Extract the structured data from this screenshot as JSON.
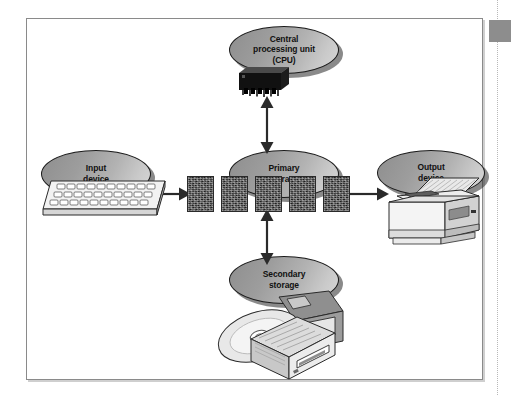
{
  "figure": {
    "nodes": [
      {
        "id": "cpu",
        "label": "Central\nprocessing unit\n(CPU)",
        "icon": "microchip-icon"
      },
      {
        "id": "input",
        "label": "Input\ndevice",
        "icon": "keyboard-icon"
      },
      {
        "id": "primary",
        "label": "Primary\nstorage",
        "icon": "memory-modules-icon"
      },
      {
        "id": "output",
        "label": "Output\ndevice",
        "icon": "printer-icon"
      },
      {
        "id": "secondary",
        "label": "Secondary\nstorage",
        "icon": "disk-drive-icon"
      }
    ],
    "memory_blocks": [
      "",
      "",
      "",
      "",
      ""
    ],
    "connections": [
      {
        "id": "input-to-primary",
        "from": "input",
        "to": "primary",
        "style": "single",
        "direction": "right"
      },
      {
        "id": "primary-to-output",
        "from": "primary",
        "to": "output",
        "style": "single",
        "direction": "right"
      },
      {
        "id": "cpu-to-primary",
        "from": "cpu",
        "to": "primary",
        "style": "double",
        "direction": "vertical"
      },
      {
        "id": "primary-to-secondary",
        "from": "primary",
        "to": "secondary",
        "style": "double",
        "direction": "vertical"
      }
    ],
    "colors": {
      "ellipse_dark": "#8e8e8e",
      "ellipse_light": "#d8d8d8",
      "outline": "#1b1b1b",
      "memory_block": "#3b3b3b",
      "frame_border": "#8a8a8a",
      "margin_tab": "#8d8d8d",
      "page_background": "#ffffff"
    }
  },
  "margin": {
    "tab_label": "",
    "rule_style": "dotted"
  }
}
